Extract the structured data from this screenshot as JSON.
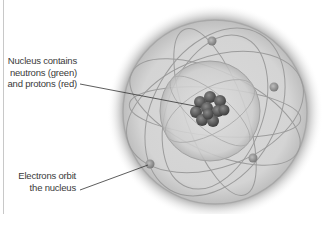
{
  "diagram": {
    "labels": {
      "nucleus": {
        "lines": [
          "Nucleus contains",
          "neutrons (green)",
          "and protons (red)"
        ]
      },
      "electrons": {
        "lines": [
          "Electrons orbit",
          "the nucleus"
        ]
      }
    },
    "colors": {
      "background": "#ffffff",
      "text": "#3a3a3a",
      "orbit": "#9a9a9a",
      "nucleus": "#5a5a5a",
      "leader_line": "#333333"
    }
  }
}
